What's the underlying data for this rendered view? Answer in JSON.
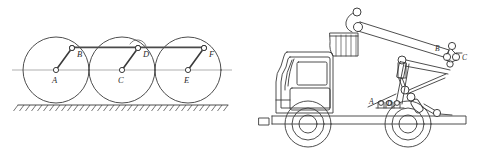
{
  "figure": {
    "background_color": "#ffffff",
    "line_color": "#3a3a3a",
    "label_color": "#2b2b2b",
    "panels": [
      {
        "id": "left",
        "name": "three-wheel-linkage",
        "description": "Three equal circles rolling on hatched ground, each with a center pin and an offset crank pin joined by a common horizontal coupler rod"
      },
      {
        "id": "right",
        "name": "truck-mounted-crane",
        "description": "Side view of a truck with cab, two wheels, chassis and an articulated boom with hydraulic cylinders and a bucket"
      }
    ]
  },
  "left_panel": {
    "axis_label": "horizontal center line",
    "ground_label": "hatched ground",
    "circles": [
      {
        "name": "wheel-a",
        "cx": 56,
        "cy": 70,
        "r": 33,
        "center_label": "A",
        "crank_label": "B",
        "crank_x": 72,
        "crank_y": 48
      },
      {
        "name": "wheel-c",
        "cx": 122,
        "cy": 70,
        "r": 33,
        "center_label": "C",
        "crank_label": "D",
        "crank_x": 138,
        "crank_y": 48
      },
      {
        "name": "wheel-e",
        "cx": 188,
        "cy": 70,
        "r": 33,
        "center_label": "E",
        "crank_label": "F",
        "crank_x": 204,
        "crank_y": 48
      }
    ],
    "labels": [
      "A",
      "B",
      "C",
      "D",
      "E",
      "F"
    ],
    "coupler_rod": {
      "name": "coupler-rod",
      "x1": 72,
      "y1": 48,
      "x2": 204,
      "y2": 48
    }
  },
  "right_panel": {
    "labels": [
      {
        "text": "A",
        "x": 372,
        "y": 103,
        "name": "joint-label-a"
      },
      {
        "text": "B",
        "x": 437,
        "y": 51,
        "name": "joint-label-b"
      },
      {
        "text": "C",
        "x": 461,
        "y": 60,
        "name": "joint-label-c"
      },
      {
        "text": "D",
        "x": 390,
        "y": 105,
        "name": "joint-label-d"
      }
    ],
    "parts": [
      {
        "name": "truck-cab",
        "label": "cab"
      },
      {
        "name": "truck-chassis",
        "label": "chassis"
      },
      {
        "name": "front-wheel",
        "label": "front wheel"
      },
      {
        "name": "rear-wheel",
        "label": "rear wheel"
      },
      {
        "name": "crane-boom",
        "label": "boom"
      },
      {
        "name": "crane-bucket",
        "label": "bucket"
      },
      {
        "name": "hydraulic-cylinder-upper",
        "label": "upper cylinder"
      },
      {
        "name": "hydraulic-cylinder-lower",
        "label": "lower cylinder"
      }
    ]
  }
}
